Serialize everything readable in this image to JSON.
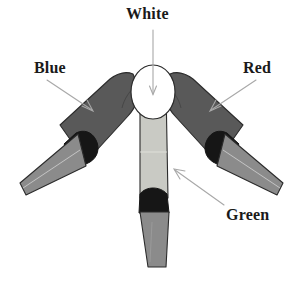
{
  "figure": {
    "background_color": "#ffffff",
    "labels": [
      {
        "id": "white",
        "text": "White",
        "icon": "leader-line-arrow-down-icon",
        "points_to": "central-hub-ellipse",
        "arrow_direction": "down"
      },
      {
        "id": "blue",
        "text": "Blue",
        "icon": "leader-line-arrow-down-right-icon",
        "points_to": "left-limb",
        "arrow_direction": "down-right"
      },
      {
        "id": "red",
        "text": "Red",
        "icon": "leader-line-arrow-down-left-icon",
        "points_to": "right-limb",
        "arrow_direction": "down-left"
      },
      {
        "id": "green",
        "text": "Green",
        "icon": "leader-line-arrow-up-left-icon",
        "points_to": "center-limb",
        "arrow_direction": "up-left"
      }
    ],
    "colors": {
      "limb_dark_gray": "#595959",
      "limb_mid_gray": "#8b8b8b",
      "limb_light_gray": "#c9cac4",
      "band_black": "#161616",
      "hub_white": "#ffffff",
      "outline": "#2b2b2b",
      "leader_line": "#a8a8a8",
      "label_text": "#1a1a1a"
    },
    "parts": [
      {
        "id": "left-limb",
        "label": "Blue",
        "upper_color": "#595959",
        "band_color": "#161616",
        "tip_color": "#8b8b8b"
      },
      {
        "id": "right-limb",
        "label": "Red",
        "upper_color": "#595959",
        "band_color": "#161616",
        "tip_color": "#8b8b8b"
      },
      {
        "id": "center-limb",
        "label": "Green",
        "upper_color": "#c9cac4",
        "band_color": "#161616",
        "tip_color": "#8b8b8b"
      },
      {
        "id": "central-hub-ellipse",
        "label": "White",
        "upper_color": "#ffffff",
        "band_color": "",
        "tip_color": ""
      }
    ]
  }
}
